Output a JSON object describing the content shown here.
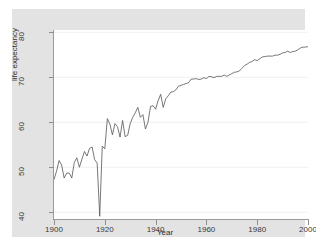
{
  "chart_data": {
    "type": "line",
    "title": "",
    "xlabel": "Year",
    "ylabel": "life expectancy",
    "xlim": [
      1900,
      2000
    ],
    "ylim": [
      38.5,
      80.5
    ],
    "xticks": [
      1900,
      1920,
      1940,
      1960,
      1980,
      2000
    ],
    "yticks": [
      40,
      50,
      60,
      70,
      80
    ],
    "grid": "horizontal",
    "legend": "none",
    "line_color": "#555555",
    "x": [
      1900,
      1901,
      1902,
      1903,
      1904,
      1905,
      1906,
      1907,
      1908,
      1909,
      1910,
      1911,
      1912,
      1913,
      1914,
      1915,
      1916,
      1917,
      1918,
      1919,
      1920,
      1921,
      1922,
      1923,
      1924,
      1925,
      1926,
      1927,
      1928,
      1929,
      1930,
      1931,
      1932,
      1933,
      1934,
      1935,
      1936,
      1937,
      1938,
      1939,
      1940,
      1941,
      1942,
      1943,
      1944,
      1945,
      1946,
      1947,
      1948,
      1949,
      1950,
      1951,
      1952,
      1953,
      1954,
      1955,
      1956,
      1957,
      1958,
      1959,
      1960,
      1961,
      1962,
      1963,
      1964,
      1965,
      1966,
      1967,
      1968,
      1969,
      1970,
      1971,
      1972,
      1973,
      1974,
      1975,
      1976,
      1977,
      1978,
      1979,
      1980,
      1981,
      1982,
      1983,
      1984,
      1985,
      1986,
      1987,
      1988,
      1989,
      1990,
      1991,
      1992,
      1993,
      1994,
      1995,
      1996,
      1997,
      1998,
      1999,
      2000
    ],
    "values": [
      47.3,
      49.1,
      51.5,
      50.5,
      47.6,
      48.7,
      48.7,
      47.6,
      51.1,
      52.1,
      50.0,
      51.8,
      53.5,
      52.5,
      54.2,
      54.5,
      51.7,
      50.9,
      39.1,
      54.7,
      54.1,
      60.8,
      59.6,
      57.2,
      59.7,
      59.0,
      56.7,
      60.4,
      56.8,
      57.1,
      59.7,
      61.1,
      62.1,
      63.3,
      61.1,
      61.7,
      58.5,
      60.0,
      63.5,
      63.7,
      62.9,
      64.8,
      66.2,
      63.3,
      65.2,
      65.9,
      66.7,
      66.8,
      67.2,
      68.0,
      68.2,
      68.4,
      68.6,
      68.8,
      69.6,
      69.6,
      69.7,
      69.5,
      69.6,
      69.9,
      69.7,
      70.2,
      70.1,
      69.9,
      70.2,
      70.2,
      70.2,
      70.5,
      70.2,
      70.5,
      70.8,
      71.1,
      71.2,
      71.4,
      72.0,
      72.6,
      72.9,
      73.3,
      73.5,
      73.9,
      73.7,
      74.1,
      74.5,
      74.6,
      74.7,
      74.7,
      74.7,
      74.9,
      74.9,
      75.1,
      75.4,
      75.5,
      75.8,
      75.5,
      75.7,
      75.8,
      76.1,
      76.5,
      76.7,
      76.7,
      76.8
    ]
  },
  "axes": {
    "y_tick_labels": [
      "80",
      "70",
      "60",
      "50",
      "40"
    ],
    "x_tick_labels": [
      "1900",
      "1920",
      "1940",
      "1960",
      "1980",
      "2000"
    ],
    "y_axis_title": "life expectancy",
    "x_axis_title": "Year"
  }
}
